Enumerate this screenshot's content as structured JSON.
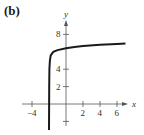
{
  "panel_label": "(b)",
  "chart_data": {
    "type": "line",
    "title": "",
    "xlabel": "x",
    "ylabel": "y",
    "xticks": [
      -4,
      2,
      4,
      6
    ],
    "yticks": [
      2,
      4,
      8
    ],
    "xlim": [
      -4.2,
      7.5
    ],
    "ylim": [
      -3,
      9
    ],
    "grid": false,
    "series": [
      {
        "name": "f(x)",
        "x": [
          -2.0,
          -1.98,
          -1.95,
          -1.9,
          -1.8,
          -1.5,
          -1,
          0,
          1,
          2,
          4,
          6,
          7
        ],
        "y": [
          -3,
          2,
          4,
          5,
          5.6,
          6,
          6.2,
          6.4,
          6.55,
          6.65,
          6.8,
          6.9,
          6.95
        ]
      }
    ]
  }
}
